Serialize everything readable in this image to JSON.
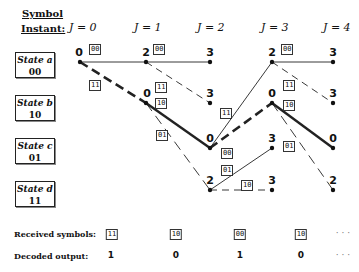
{
  "header": {
    "symbol_label": "Symbol",
    "instant_label": "Instant:",
    "instants": [
      "J = 0",
      "J = 1",
      "J = 2",
      "J = 3",
      "J = 4"
    ]
  },
  "states": [
    {
      "name": "State a",
      "code": "00"
    },
    {
      "name": "State b",
      "code": "10"
    },
    {
      "name": "State c",
      "code": "01"
    },
    {
      "name": "State d",
      "code": "11"
    }
  ],
  "node_metrics": {
    "j0_a": "0",
    "j1_a": "2",
    "j1_b": "0",
    "j2_a": "3",
    "j2_b": "3",
    "j2_c": "0",
    "j2_d": "2",
    "j3_a": "2",
    "j3_b": "0",
    "j3_c": "3",
    "j3_d": "3",
    "j4_a": "3",
    "j4_b": "3",
    "j4_c": "0",
    "j4_d": "2"
  },
  "branch_labels": {
    "j0_a_a": "00",
    "j0_a_b": "11",
    "j1_a_a": "00",
    "j1_a_b": "11",
    "j1_b_c": "10",
    "j1_b_d": "01",
    "j2_c_b": "00",
    "j2_b_label": "11",
    "j2_d_c": "01",
    "j2_d_d": "10",
    "j3_a_a": "00",
    "j3_a_b": "11",
    "j3_b_c": "10",
    "j3_b_d": "01"
  },
  "footer": {
    "received_label": "Received symbols:",
    "received": [
      "11",
      "10",
      "00",
      "10",
      "· · ·"
    ],
    "decoded_label": "Decoded output:",
    "decoded": [
      "1",
      "0",
      "1",
      "0",
      "· · ·"
    ]
  },
  "colors": {
    "line": "#222222",
    "background": "#ffffff"
  }
}
